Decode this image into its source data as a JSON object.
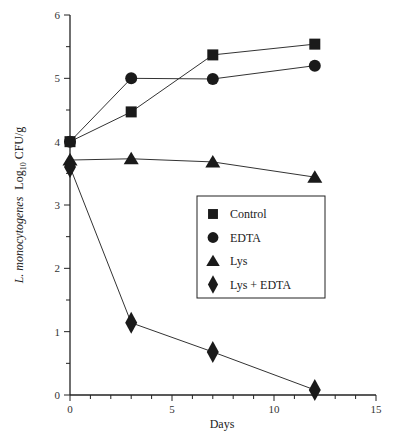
{
  "chart_data": {
    "type": "line",
    "title": "",
    "xlabel": "Days",
    "ylabel_italic": "L. monocytogenes",
    "ylabel_log": "Log",
    "ylabel_sub": "10",
    "ylabel_unit": "CFU/g",
    "xlim": [
      0,
      15
    ],
    "ylim": [
      0,
      6
    ],
    "xticks": [
      0,
      5,
      10,
      15
    ],
    "yticks": [
      0,
      1,
      2,
      3,
      4,
      5,
      6
    ],
    "x_minor_step": 1,
    "y_minor_step": 0.5,
    "grid": false,
    "legend_position": "center-right",
    "series": [
      {
        "name": "Control",
        "marker": "square",
        "x": [
          0,
          3,
          7,
          12
        ],
        "values": [
          4.0,
          4.47,
          5.37,
          5.54
        ]
      },
      {
        "name": "EDTA",
        "marker": "circle",
        "x": [
          0,
          3,
          7,
          12
        ],
        "values": [
          4.0,
          5.0,
          4.99,
          5.2
        ]
      },
      {
        "name": "Lys",
        "marker": "triangle",
        "x": [
          0,
          3,
          7,
          12
        ],
        "values": [
          3.71,
          3.73,
          3.68,
          3.44
        ]
      },
      {
        "name": "Lys + EDTA",
        "marker": "diamond",
        "x": [
          0,
          3,
          7,
          12
        ],
        "values": [
          3.6,
          1.14,
          0.68,
          0.08
        ]
      }
    ]
  },
  "colors": {
    "marker": "#1a1a1a",
    "line": "#333333",
    "axis": "#222222"
  }
}
